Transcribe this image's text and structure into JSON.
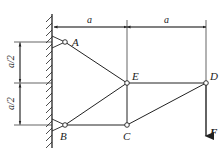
{
  "diagram": {
    "type": "truss",
    "nodes": {
      "A": {
        "label": "A",
        "x": 65,
        "y": 42
      },
      "B": {
        "label": "B",
        "x": 65,
        "y": 125
      },
      "C": {
        "label": "C",
        "x": 127,
        "y": 125
      },
      "D": {
        "label": "D",
        "x": 206,
        "y": 83
      },
      "E": {
        "label": "E",
        "x": 127,
        "y": 83
      }
    },
    "members": [
      [
        "A",
        "E"
      ],
      [
        "B",
        "E"
      ],
      [
        "B",
        "C"
      ],
      [
        "C",
        "E"
      ],
      [
        "E",
        "D"
      ],
      [
        "C",
        "D"
      ]
    ],
    "supports": [
      "A",
      "B"
    ],
    "load": {
      "label": "F",
      "at": "D",
      "direction": "down"
    },
    "dimensions": {
      "top_left": "a",
      "top_right": "a",
      "left_upper": "a/2",
      "left_lower": "a/2"
    }
  }
}
